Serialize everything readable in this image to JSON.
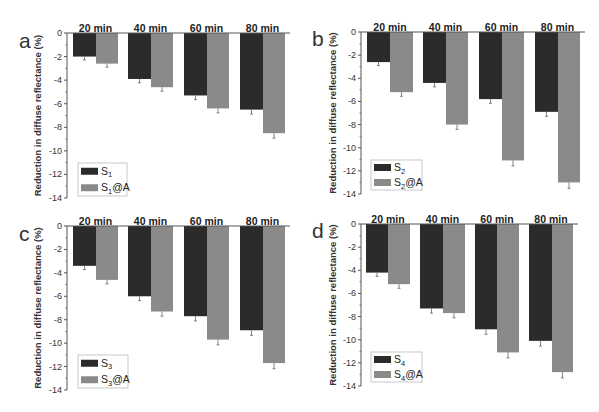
{
  "chart_data": [
    {
      "panel": "a",
      "type": "bar",
      "title": "",
      "xlabel": "",
      "ylabel": "Reduction in diffuse reflectance (%)",
      "categories": [
        "20 min",
        "40 min",
        "60 min",
        "80 min"
      ],
      "series": [
        {
          "name": "S1",
          "label_base": "S",
          "label_sub": "1",
          "label_suffix": "",
          "values": [
            -2.0,
            -3.9,
            -5.3,
            -6.5
          ]
        },
        {
          "name": "S1@A",
          "label_base": "S",
          "label_sub": "1",
          "label_suffix": "@A",
          "values": [
            -2.6,
            -4.6,
            -6.4,
            -8.5
          ]
        }
      ],
      "ylim": [
        -14,
        0
      ],
      "yticks": [
        0,
        -2,
        -4,
        -6,
        -8,
        -10,
        -12,
        -14
      ],
      "legend_position": "lower left",
      "grid": false,
      "error_bars": true
    },
    {
      "panel": "b",
      "type": "bar",
      "title": "",
      "xlabel": "",
      "ylabel": "Reduction in diffuse reflectance (%)",
      "categories": [
        "20 min",
        "40 min",
        "60 min",
        "80 min"
      ],
      "series": [
        {
          "name": "S2",
          "label_base": "S",
          "label_sub": "2",
          "label_suffix": "",
          "values": [
            -2.6,
            -4.4,
            -5.8,
            -6.9
          ]
        },
        {
          "name": "S2@A",
          "label_base": "S",
          "label_sub": "2",
          "label_suffix": "@A",
          "values": [
            -5.2,
            -8.0,
            -11.1,
            -13.0
          ]
        }
      ],
      "ylim": [
        -14,
        0
      ],
      "yticks": [
        0,
        -2,
        -4,
        -6,
        -8,
        -10,
        -12,
        -14
      ],
      "legend_position": "lower left",
      "grid": false,
      "error_bars": true
    },
    {
      "panel": "c",
      "type": "bar",
      "title": "",
      "xlabel": "",
      "ylabel": "Reduction in diffuse reflectance (%)",
      "categories": [
        "20 min",
        "40 min",
        "60 min",
        "80 min"
      ],
      "series": [
        {
          "name": "S3",
          "label_base": "S",
          "label_sub": "3",
          "label_suffix": "",
          "values": [
            -3.4,
            -6.0,
            -7.7,
            -8.9
          ]
        },
        {
          "name": "S3@A",
          "label_base": "S",
          "label_sub": "3",
          "label_suffix": "@A",
          "values": [
            -4.6,
            -7.3,
            -9.7,
            -11.7
          ]
        }
      ],
      "ylim": [
        -14,
        0
      ],
      "yticks": [
        0,
        -2,
        -4,
        -6,
        -8,
        -10,
        -12,
        -14
      ],
      "legend_position": "lower left",
      "grid": false,
      "error_bars": true
    },
    {
      "panel": "d",
      "type": "bar",
      "title": "",
      "xlabel": "",
      "ylabel": "Reduction in diffuse reflectance (%)",
      "categories": [
        "20 min",
        "40 min",
        "60 min",
        "80 min"
      ],
      "series": [
        {
          "name": "S4",
          "label_base": "S",
          "label_sub": "4",
          "label_suffix": "",
          "values": [
            -4.2,
            -7.3,
            -9.1,
            -10.1
          ]
        },
        {
          "name": "S4@A",
          "label_base": "S",
          "label_sub": "4",
          "label_suffix": "@A",
          "values": [
            -5.2,
            -7.7,
            -11.1,
            -12.8
          ]
        }
      ],
      "ylim": [
        -14,
        0
      ],
      "yticks": [
        0,
        -2,
        -4,
        -6,
        -8,
        -10,
        -12,
        -14
      ],
      "legend_position": "lower left",
      "grid": false,
      "error_bars": true
    }
  ],
  "colors": {
    "series_dark": "#2b2b2b",
    "series_light": "#8a8a8a",
    "axis": "#555555",
    "error_bar": "#666666"
  },
  "layout": [
    {
      "x0": 67,
      "x_end": 290,
      "y0": 33,
      "y_min": 198,
      "bars": [
        [
          73,
          96,
          118
        ],
        [
          128,
          151,
          173
        ],
        [
          184,
          207,
          229
        ],
        [
          240,
          263,
          285
        ]
      ],
      "legend": [
        78,
        163,
        127,
        196
      ],
      "letter_pos": [
        19,
        48
      ],
      "ylabel_x": 41
    },
    {
      "x0": 361,
      "x_end": 585,
      "y0": 32,
      "y_min": 194,
      "bars": [
        [
          367,
          390,
          413
        ],
        [
          423,
          446,
          468
        ],
        [
          479,
          502,
          524
        ],
        [
          535,
          558,
          580
        ]
      ],
      "legend": [
        371,
        160,
        422,
        190
      ],
      "letter_pos": [
        312,
        46
      ],
      "ylabel_x": 336
    },
    {
      "x0": 67,
      "x_end": 290,
      "y0": 226,
      "y_min": 390,
      "bars": [
        [
          73,
          96,
          118
        ],
        [
          128,
          151,
          173
        ],
        [
          184,
          207,
          229
        ],
        [
          240,
          263,
          285
        ]
      ],
      "legend": [
        78,
        355,
        128,
        388
      ],
      "letter_pos": [
        19,
        241
      ],
      "ylabel_x": 41
    },
    {
      "x0": 361,
      "x_end": 578,
      "y0": 224,
      "y_min": 386,
      "bars": [
        [
          366,
          388,
          410
        ],
        [
          420,
          443,
          465
        ],
        [
          475,
          497,
          519
        ],
        [
          529,
          552,
          573
        ]
      ],
      "legend": [
        371,
        352,
        422,
        382
      ],
      "letter_pos": [
        312,
        238
      ],
      "ylabel_x": 336
    }
  ]
}
